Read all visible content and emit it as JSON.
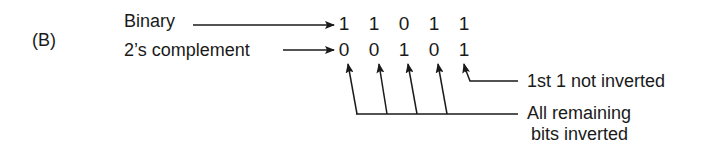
{
  "figure": {
    "panel_label": "(B)",
    "rows": [
      {
        "label": "Binary",
        "bits": [
          "1",
          "1",
          "0",
          "1",
          "1"
        ]
      },
      {
        "label": "2’s complement",
        "bits": [
          "0",
          "0",
          "1",
          "0",
          "1"
        ]
      }
    ],
    "annotations": {
      "first_one": "1st 1 not inverted",
      "remaining_line1": "All remaining",
      "remaining_line2": "bits inverted"
    },
    "colors": {
      "ink": "#1a1a1a",
      "background": "#ffffff"
    }
  }
}
